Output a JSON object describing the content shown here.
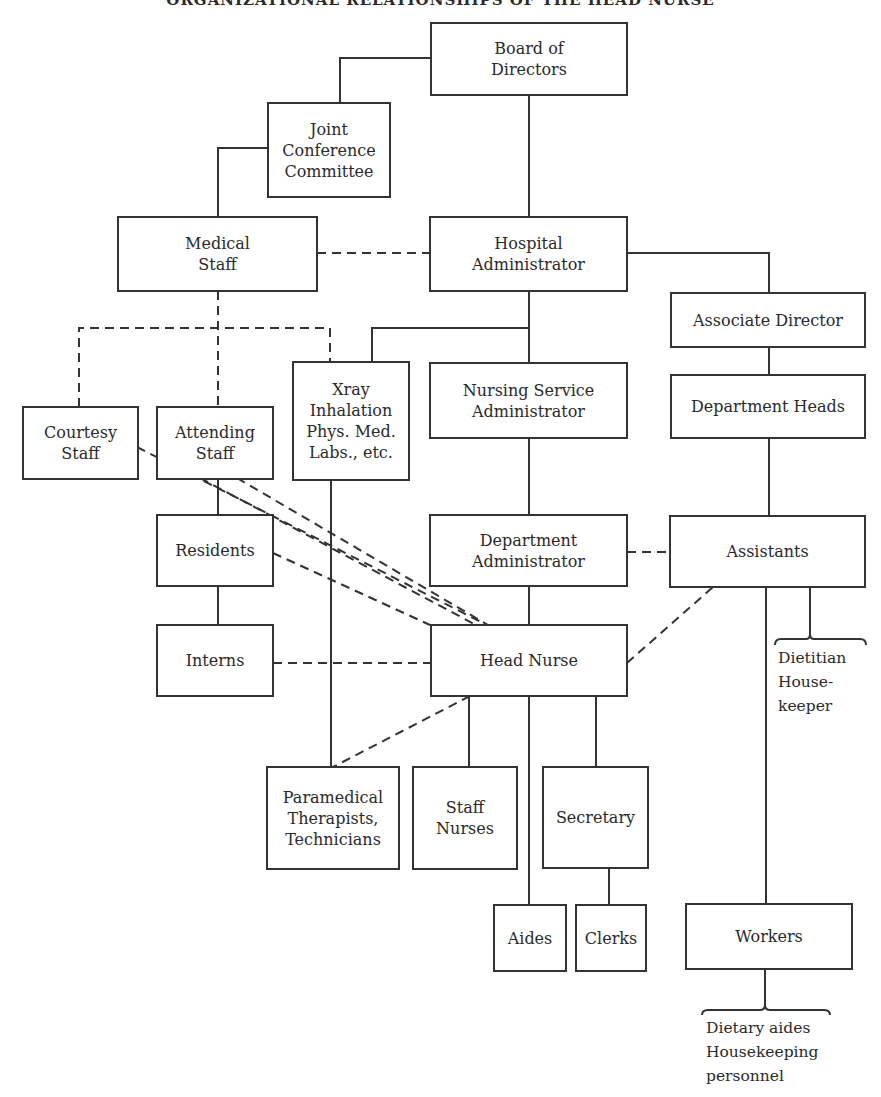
{
  "title": "ORGANIZATIONAL RELATIONSHIPS OF THE HEAD NURSE",
  "colors": {
    "line": "#333333",
    "text": "#2a2a2a",
    "background": "#ffffff"
  },
  "boxes": {
    "board": "Board of\nDirectors",
    "joint": "Joint\nConference\nCommittee",
    "medical": "Medical\nStaff",
    "hospital_admin": "Hospital\nAdministrator",
    "assoc_director": "Associate Director",
    "xray": "Xray\nInhalation\nPhys. Med.\nLabs., etc.",
    "nursing_service": "Nursing Service\nAdministrator",
    "dept_heads": "Department Heads",
    "courtesy": "Courtesy\nStaff",
    "attending": "Attending\nStaff",
    "residents": "Residents",
    "dept_admin": "Department\nAdministrator",
    "assistants": "Assistants",
    "interns": "Interns",
    "head_nurse": "Head Nurse",
    "paramedical": "Paramedical\nTherapists,\nTechnicians",
    "staff_nurses": "Staff\nNurses",
    "secretary": "Secretary",
    "aides": "Aides",
    "clerks": "Clerks",
    "workers": "Workers"
  },
  "labels": {
    "assistants_sub": "Dietitian\nHouse-\n keeper",
    "workers_sub": "Dietary aides\nHousekeeping\n personnel"
  },
  "legend": {
    "solid": "line authority",
    "dashed": "cooperative relationship"
  }
}
